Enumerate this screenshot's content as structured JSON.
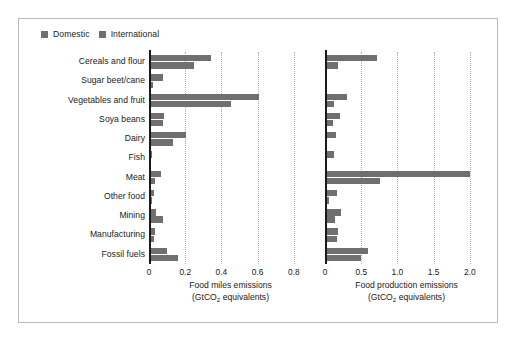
{
  "legend": {
    "entries": [
      {
        "label": "Domestic",
        "color": "#6f6f6f",
        "swatch_icon": "square-marker-icon"
      },
      {
        "label": "International",
        "color": "#6f6f6f",
        "swatch_icon": "square-marker-icon"
      }
    ]
  },
  "chart_data": {
    "type": "bar",
    "orientation": "horizontal",
    "title": "",
    "grid": true,
    "legend_position": "top-left",
    "categories": [
      "Cereals and flour",
      "Sugar beet/cane",
      "Vegetables and fruit",
      "Soya beans",
      "Dairy",
      "Fish",
      "Meat",
      "Other food",
      "Mining",
      "Manufacturing",
      "Fossil fuels"
    ],
    "panels": [
      {
        "key": "food_miles",
        "xlabel_line1": "Food miles emissions",
        "xlabel_line2_prefix": "(GtCO",
        "xlabel_line2_sub": "2",
        "xlabel_line2_suffix": " equivalents)",
        "xlim": [
          0,
          0.9
        ],
        "xticks": [
          0,
          0.2,
          0.4,
          0.6,
          0.8
        ],
        "xticklabels": [
          "0",
          "0.2",
          "0.4",
          "0.6",
          "0.8"
        ],
        "series": [
          {
            "name": "Domestic",
            "values": [
              0.345,
              0.075,
              0.605,
              0.085,
              0.205,
              0.018,
              0.065,
              0.03,
              0.04,
              0.035,
              0.1
            ]
          },
          {
            "name": "International",
            "values": [
              0.25,
              0.022,
              0.45,
              0.075,
              0.135,
              0.013,
              0.035,
              0.018,
              0.08,
              0.027,
              0.16
            ]
          }
        ]
      },
      {
        "key": "food_production",
        "xlabel_line1": "Food production emissions",
        "xlabel_line2_prefix": "(GtCO",
        "xlabel_line2_sub": "2",
        "xlabel_line2_suffix": " equivalents)",
        "xlim": [
          0,
          2.25
        ],
        "xticks": [
          0,
          0.5,
          1.0,
          1.5,
          2.0
        ],
        "xticklabels": [
          "0",
          "0.5",
          "1.0",
          "1.5",
          "2.0"
        ],
        "series": [
          {
            "name": "Domestic",
            "values": [
              0.72,
              0.0,
              0.31,
              0.205,
              0.15,
              0.12,
              2.0,
              0.165,
              0.215,
              0.175,
              0.6
            ]
          },
          {
            "name": "International",
            "values": [
              0.18,
              0.0,
              0.125,
              0.105,
              0.0,
              0.0,
              0.755,
              0.055,
              0.135,
              0.16,
              0.495
            ]
          }
        ]
      }
    ]
  },
  "style": {
    "bar_color": "#6f6f6f",
    "text_color": "#1a1a1a",
    "grid_color": "#b0b0b0",
    "frame_color": "#b9b9b9",
    "background": "#ffffff"
  }
}
